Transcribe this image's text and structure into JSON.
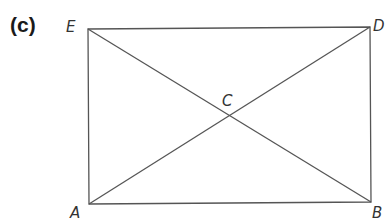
{
  "figure": {
    "part_label": "(c)",
    "points": {
      "E": {
        "label": "E",
        "x": 88,
        "y": 29
      },
      "D": {
        "label": "D",
        "x": 370,
        "y": 27
      },
      "A": {
        "label": "A",
        "x": 89,
        "y": 204
      },
      "B": {
        "label": "B",
        "x": 371,
        "y": 202
      },
      "C": {
        "label": "C",
        "x": 229,
        "y": 115
      }
    },
    "segments": [
      "ED",
      "DB",
      "BA",
      "AE",
      "EB",
      "AD"
    ],
    "line_color": "#555555"
  }
}
